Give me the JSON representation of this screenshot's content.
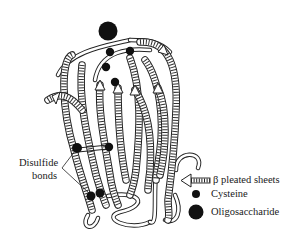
{
  "figure": {
    "type": "protein-structure-ribbon-diagram",
    "callout": {
      "label_line1": "Disulfide",
      "label_line2": "bonds"
    },
    "legend": {
      "items": [
        {
          "symbol": "arrow-ribbon",
          "label": "β pleated sheets"
        },
        {
          "symbol": "small-dot",
          "label": "Cysteine"
        },
        {
          "symbol": "large-dot",
          "label": "Oligosaccharide"
        }
      ]
    },
    "colors": {
      "ink": "#1a1a1a",
      "background": "#ffffff"
    }
  }
}
